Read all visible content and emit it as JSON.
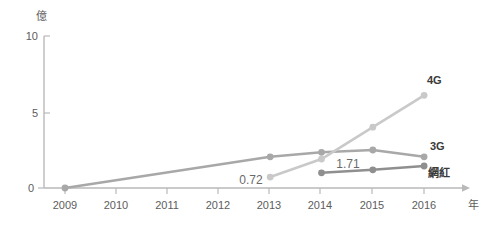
{
  "chart_data": {
    "type": "line",
    "title": "",
    "xlabel": "年",
    "ylabel": "億",
    "categories": [
      "2009",
      "2010",
      "2011",
      "2012",
      "2013",
      "2014",
      "2015",
      "2016"
    ],
    "xlim": [
      2009,
      2016
    ],
    "ylim": [
      0,
      10
    ],
    "yticks": [
      0,
      5,
      10
    ],
    "ytick_labels": [
      "0",
      "5",
      "10"
    ],
    "grid": false,
    "legend_position": "right-inline",
    "series": [
      {
        "name": "4G",
        "color": "#c9c9c9",
        "x": [
          "2013",
          "2014",
          "2015",
          "2016"
        ],
        "values": [
          0.72,
          1.9,
          4.0,
          6.1
        ]
      },
      {
        "name": "3G",
        "color": "#a8a8a8",
        "x": [
          "2009",
          "2013",
          "2014",
          "2015",
          "2016"
        ],
        "values": [
          0.0,
          2.05,
          2.35,
          2.5,
          2.05
        ]
      },
      {
        "name": "網紅",
        "color": "#8f8f8f",
        "x": [
          "2014",
          "2015",
          "2016"
        ],
        "values": [
          1.0,
          1.2,
          1.45
        ]
      }
    ],
    "annotations": [
      {
        "text": "0.72",
        "series": "4G",
        "at_x": "2013",
        "at_y": 0.72
      },
      {
        "text": "1.71",
        "series": "網紅",
        "at_x": "2014",
        "at_y": 1.71
      }
    ]
  },
  "axes": {
    "y_unit": "億",
    "x_unit": "年",
    "y_ticks": [
      {
        "label": "10"
      },
      {
        "label": "5"
      },
      {
        "label": "0"
      }
    ],
    "x_ticks": [
      {
        "label": "2009"
      },
      {
        "label": "2010"
      },
      {
        "label": "2011"
      },
      {
        "label": "2012"
      },
      {
        "label": "2013"
      },
      {
        "label": "2014"
      },
      {
        "label": "2015"
      },
      {
        "label": "2016"
      }
    ]
  },
  "labels": {
    "series_4g": "4G",
    "series_3g": "3G",
    "series_wanghong": "網紅",
    "value_072": "0.72",
    "value_171": "1.71"
  },
  "colors": {
    "axis": "#b9b9b9",
    "text": "#5d5d5d",
    "series_4g": "#c9c9c9",
    "series_3g": "#a8a8a8",
    "series_wanghong": "#8f8f8f",
    "background": "#ffffff"
  }
}
